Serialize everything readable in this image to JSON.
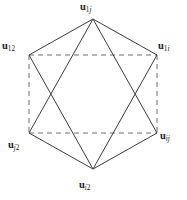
{
  "figure": {
    "type": "node-link-diagram",
    "background_color": "#ffffff",
    "line_color": "#3c3c3c",
    "dashed_color": "#6e6e6e",
    "text_color": "#1a1a1a"
  },
  "vertices": [
    {
      "id": "top",
      "label_main": "u",
      "label_sub": "1j",
      "sub_parts": [
        {
          "text": "1",
          "italic": false
        },
        {
          "text": "j",
          "italic": true
        }
      ],
      "x": 93,
      "y": 19,
      "label_position": "above"
    },
    {
      "id": "upper_left",
      "label_main": "u",
      "label_sub": "12",
      "sub_parts": [
        {
          "text": "12",
          "italic": false
        }
      ],
      "x": 29,
      "y": 55,
      "label_position": "left"
    },
    {
      "id": "upper_right",
      "label_main": "u",
      "label_sub": "1i",
      "sub_parts": [
        {
          "text": "1",
          "italic": false
        },
        {
          "text": "i",
          "italic": true
        }
      ],
      "x": 157,
      "y": 55,
      "label_position": "right"
    },
    {
      "id": "lower_left",
      "label_main": "u",
      "label_sub": "j2",
      "sub_parts": [
        {
          "text": "j",
          "italic": true
        },
        {
          "text": "2",
          "italic": false
        }
      ],
      "x": 29,
      "y": 133,
      "label_position": "below-left"
    },
    {
      "id": "lower_right",
      "label_main": "u",
      "label_sub": "ij",
      "sub_parts": [
        {
          "text": "ij",
          "italic": true
        }
      ],
      "x": 157,
      "y": 133,
      "label_position": "right"
    },
    {
      "id": "bottom",
      "label_main": "u",
      "label_sub": "i2",
      "sub_parts": [
        {
          "text": "i",
          "italic": true
        },
        {
          "text": "2",
          "italic": false
        }
      ],
      "x": 93,
      "y": 169,
      "label_position": "below"
    }
  ],
  "edges": [
    {
      "from": "upper_left",
      "to": "upper_right",
      "style": "dashed"
    },
    {
      "from": "lower_left",
      "to": "lower_right",
      "style": "dashed"
    },
    {
      "from": "upper_left",
      "to": "lower_left",
      "style": "dashed"
    },
    {
      "from": "upper_right",
      "to": "lower_right",
      "style": "dashed"
    },
    {
      "from": "top",
      "to": "upper_left",
      "style": "solid"
    },
    {
      "from": "top",
      "to": "upper_right",
      "style": "solid"
    },
    {
      "from": "top",
      "to": "lower_left",
      "style": "solid"
    },
    {
      "from": "top",
      "to": "lower_right",
      "style": "solid"
    },
    {
      "from": "bottom",
      "to": "lower_left",
      "style": "solid"
    },
    {
      "from": "bottom",
      "to": "lower_right",
      "style": "solid"
    },
    {
      "from": "bottom",
      "to": "upper_left",
      "style": "solid"
    },
    {
      "from": "bottom",
      "to": "upper_right",
      "style": "solid"
    }
  ],
  "labels": {
    "top": {
      "base": "u",
      "sub": "1j"
    },
    "upper_left": {
      "base": "u",
      "sub": "12"
    },
    "upper_right": {
      "base": "u",
      "sub": "1i"
    },
    "lower_left": {
      "base": "u",
      "sub": "j2"
    },
    "lower_right": {
      "base": "u",
      "sub": "ij"
    },
    "bottom": {
      "base": "u",
      "sub": "i2"
    }
  }
}
